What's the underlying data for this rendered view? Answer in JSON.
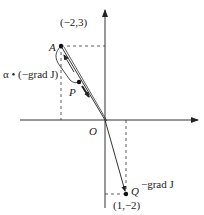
{
  "diagram": {
    "title": "",
    "origin_label": "O",
    "points": {
      "A": {
        "label": "A",
        "coords": "(−2,3)"
      },
      "P": {
        "label": "P"
      },
      "Q": {
        "label": "Q",
        "coords": "(1,−2)"
      }
    },
    "annotations": {
      "neg_grad": "−grad J",
      "step": "α • (−grad J)"
    },
    "colors": {
      "line": "#333333",
      "background": "#ffffff"
    }
  }
}
